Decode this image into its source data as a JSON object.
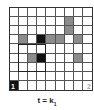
{
  "grid": {
    "rows": 9,
    "cols": 9,
    "cells": [
      {
        "row": 1,
        "col": 6,
        "fill": "gray"
      },
      {
        "row": 2,
        "col": 6,
        "fill": "gray"
      },
      {
        "row": 3,
        "col": 1,
        "fill": "gray"
      },
      {
        "row": 3,
        "col": 3,
        "fill": "black"
      },
      {
        "row": 3,
        "col": 4,
        "fill": "gray"
      },
      {
        "row": 3,
        "col": 5,
        "fill": "gray"
      },
      {
        "row": 3,
        "col": 7,
        "fill": "gray"
      },
      {
        "row": 5,
        "col": 2,
        "fill": "gray"
      },
      {
        "row": 5,
        "col": 3,
        "fill": "black"
      },
      {
        "row": 5,
        "col": 7,
        "fill": "gray"
      },
      {
        "row": 8,
        "col": 0,
        "fill": "black",
        "label": "1"
      },
      {
        "row": 8,
        "col": 8,
        "fill": "white",
        "label": "2"
      }
    ],
    "outline": {
      "row_start": 4,
      "row_end": 6,
      "col_start": 1,
      "col_end": 3
    }
  },
  "caption": {
    "text": "t = k",
    "subscript": "1"
  },
  "colors": {
    "gray": "#8c8c8c",
    "black": "#111111",
    "grid_line": "#555555"
  }
}
